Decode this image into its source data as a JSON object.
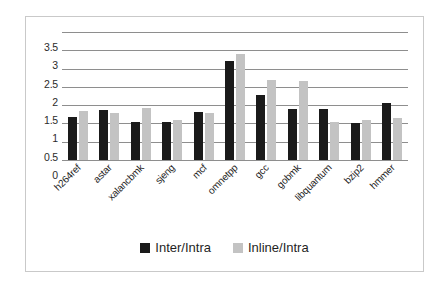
{
  "chart_data": {
    "type": "bar",
    "title": "",
    "subtitle": "",
    "xlabel": "",
    "ylabel": "",
    "ylim": [
      0,
      3.5
    ],
    "yticks": [
      "0",
      "0.5",
      "1",
      "1.5",
      "2",
      "2.5",
      "3",
      "3.5"
    ],
    "ytick_values": [
      0,
      0.5,
      1,
      1.5,
      2,
      2.5,
      3,
      3.5
    ],
    "grid": true,
    "legend_position": "bottom",
    "categories": [
      "h264ref",
      "astar",
      "xalancbmk",
      "sjeng",
      "mcf",
      "omnetpp",
      "gcc",
      "gobmk",
      "libquantum",
      "bzip2",
      "hmmer"
    ],
    "series": [
      {
        "name": "Inter/Intra",
        "color": "#1a1a1a",
        "values": [
          1.18,
          1.38,
          1.05,
          1.05,
          1.3,
          2.7,
          1.78,
          1.4,
          1.4,
          1.0,
          1.55
        ]
      },
      {
        "name": "Inline/Intra",
        "color": "#c3c3c3",
        "values": [
          1.33,
          1.28,
          1.43,
          1.1,
          1.29,
          2.9,
          2.18,
          2.15,
          1.05,
          1.09,
          1.14
        ]
      }
    ]
  },
  "legend": {
    "items": [
      {
        "label": "Inter/Intra",
        "color": "#1a1a1a"
      },
      {
        "label": "Inline/Intra",
        "color": "#c3c3c3"
      }
    ]
  },
  "colors": {
    "series_dark": "#1a1a1a",
    "series_light": "#c3c3c3",
    "gridline": "#8e8e8e",
    "border": "#c9c9c9",
    "text": "#1f1f1f",
    "background": "#ffffff"
  }
}
